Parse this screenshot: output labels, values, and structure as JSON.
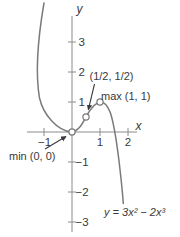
{
  "figure": {
    "axis": {
      "x_label": "x",
      "y_label": "y"
    },
    "tick_labels": {
      "y": [
        "3",
        "2",
        "1",
        "−1",
        "−2",
        "−3"
      ],
      "x": [
        "−1",
        "1",
        "2"
      ]
    },
    "annotations": {
      "min_label": "min (0, 0)",
      "inflection_label": "(1/2, 1/2)",
      "max_label": "max (1, 1)",
      "equation_label": "y = 3x² − 2x³"
    }
  },
  "chart_data": {
    "type": "line",
    "equation": "y = 3x² − 2x³",
    "equation_coefficients": {
      "x2": 3,
      "x3": -2
    },
    "xlabel": "x",
    "ylabel": "y",
    "xlim": [
      -1.6,
      2.3
    ],
    "ylim": [
      -3.6,
      4.3
    ],
    "x_ticks": [
      -1,
      1,
      2
    ],
    "y_ticks": [
      -3,
      -2,
      -1,
      1,
      2,
      3
    ],
    "grid": false,
    "legend_position": "none",
    "key_points": [
      {
        "name": "min",
        "label": "min (0, 0)",
        "x": 0,
        "y": 0,
        "marker": "open-circle"
      },
      {
        "name": "inflection",
        "label": "(1/2, 1/2)",
        "x": 0.5,
        "y": 0.5,
        "marker": "open-circle"
      },
      {
        "name": "max",
        "label": "max (1, 1)",
        "x": 1,
        "y": 1,
        "marker": "open-circle"
      }
    ],
    "series": [
      {
        "name": "y = 3x² − 2x³",
        "x": [
          -0.9,
          -0.75,
          -0.6,
          -0.45,
          -0.3,
          -0.15,
          0,
          0.15,
          0.3,
          0.45,
          0.5,
          0.6,
          0.75,
          0.9,
          1,
          1.1,
          1.25,
          1.4,
          1.5,
          1.6,
          1.75,
          1.85
        ],
        "y": [
          3.888,
          2.531,
          1.512,
          0.79,
          0.324,
          0.074,
          0,
          0.061,
          0.216,
          0.425,
          0.5,
          0.648,
          0.844,
          0.972,
          1,
          0.968,
          0.781,
          0.392,
          0,
          -0.512,
          -1.531,
          -2.396
        ]
      }
    ],
    "colors": {
      "curve": "#7a7a7a",
      "axis": "#8c8c8c",
      "text": "#3a3a3a",
      "marker_fill": "#ffffff"
    }
  }
}
